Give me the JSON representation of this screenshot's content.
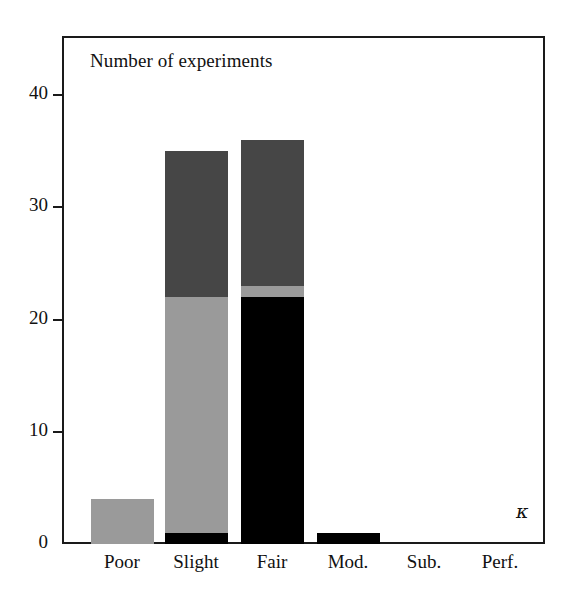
{
  "chart_data": {
    "type": "bar",
    "title": "Number of experiments",
    "xlabel": "κ",
    "ylabel": "",
    "stacked": true,
    "grid": false,
    "legend": "none",
    "ylim": [
      0,
      44
    ],
    "yticks": [
      0,
      10,
      20,
      30,
      40
    ],
    "ytick_labels": [
      "0",
      "10",
      "20",
      "30",
      "40"
    ],
    "categories": [
      "Poor",
      "Slight",
      "Fair",
      "Mod.",
      "Sub.",
      "Perf."
    ],
    "series": [
      {
        "name": "black-segment",
        "color": "#000000",
        "values": [
          0,
          1,
          22,
          1,
          0,
          0
        ]
      },
      {
        "name": "light-gray-segment",
        "color": "#9a9a9a",
        "values": [
          4,
          21,
          1,
          0,
          0,
          0
        ]
      },
      {
        "name": "dark-gray-segment",
        "color": "#464646",
        "values": [
          0,
          13,
          13,
          0,
          0,
          0
        ]
      }
    ],
    "totals": [
      4,
      35,
      36,
      1,
      0,
      0
    ],
    "annotations": [
      {
        "text": "Number of experiments",
        "position": "top-left-inside"
      },
      {
        "text": "κ",
        "position": "bottom-right-inside"
      }
    ]
  },
  "figure": {
    "background": "#ffffff",
    "frame_color": "#1a1a1a",
    "text_color": "#111111"
  },
  "axis": {
    "y_ticks": [
      {
        "label": "40",
        "value": 40
      },
      {
        "label": "30",
        "value": 30
      },
      {
        "label": "20",
        "value": 20
      },
      {
        "label": "10",
        "value": 10
      },
      {
        "label": "0",
        "value": 0
      }
    ],
    "x_ticks": [
      {
        "label": "Poor"
      },
      {
        "label": "Slight"
      },
      {
        "label": "Fair"
      },
      {
        "label": "Mod."
      },
      {
        "label": "Sub."
      },
      {
        "label": "Perf."
      }
    ]
  }
}
